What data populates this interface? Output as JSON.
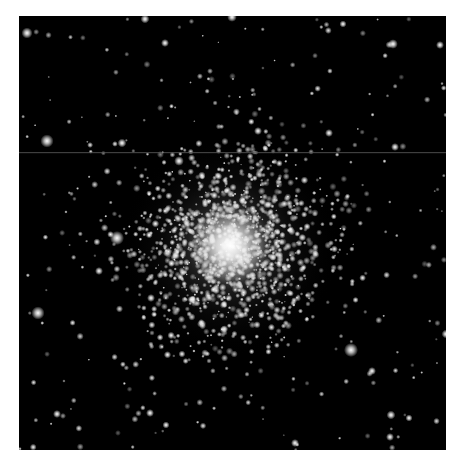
{
  "image": {
    "subject": "Globular star cluster",
    "description": "Dense spherical cluster of stars with a bright core, surrounded by scattered field stars on a black sky",
    "background_color": "#000000",
    "border_color": "#ffffff",
    "frame": {
      "x": 19,
      "y": 16,
      "width": 427,
      "height": 434
    },
    "artifact_line": {
      "y": 136,
      "color": "#5a5a5a",
      "opacity": 0.7
    },
    "cluster_core": {
      "cx": 211,
      "cy": 230,
      "radius": 110,
      "core_glow_radius": 45
    },
    "bright_stars": [
      {
        "x": 8,
        "y": 17,
        "r": 2.5
      },
      {
        "x": 126,
        "y": 3,
        "r": 2.0
      },
      {
        "x": 213,
        "y": 1,
        "r": 2.2
      },
      {
        "x": 146,
        "y": 27,
        "r": 1.8
      },
      {
        "x": 324,
        "y": 8,
        "r": 1.6
      },
      {
        "x": 374,
        "y": 28,
        "r": 2.2
      },
      {
        "x": 421,
        "y": 29,
        "r": 1.8
      },
      {
        "x": 28,
        "y": 125,
        "r": 3.0
      },
      {
        "x": 103,
        "y": 127,
        "r": 2.0
      },
      {
        "x": 239,
        "y": 115,
        "r": 1.8
      },
      {
        "x": 310,
        "y": 117,
        "r": 1.8
      },
      {
        "x": 376,
        "y": 131,
        "r": 1.8
      },
      {
        "x": 160,
        "y": 145,
        "r": 2.2
      },
      {
        "x": 98,
        "y": 222,
        "r": 3.2
      },
      {
        "x": 80,
        "y": 255,
        "r": 1.8
      },
      {
        "x": 19,
        "y": 297,
        "r": 3.0
      },
      {
        "x": 132,
        "y": 282,
        "r": 1.8
      },
      {
        "x": 332,
        "y": 334,
        "r": 3.2
      },
      {
        "x": 353,
        "y": 355,
        "r": 1.8
      },
      {
        "x": 427,
        "y": 318,
        "r": 2.0
      },
      {
        "x": 38,
        "y": 398,
        "r": 1.8
      },
      {
        "x": 131,
        "y": 397,
        "r": 1.8
      },
      {
        "x": 147,
        "y": 409,
        "r": 1.6
      },
      {
        "x": 371,
        "y": 421,
        "r": 1.8
      },
      {
        "x": 372,
        "y": 399,
        "r": 2.0
      },
      {
        "x": 390,
        "y": 402,
        "r": 1.6
      },
      {
        "x": 276,
        "y": 427,
        "r": 1.8
      }
    ],
    "field_star_count": 260,
    "cluster_star_count": 1400,
    "seed": 42
  }
}
